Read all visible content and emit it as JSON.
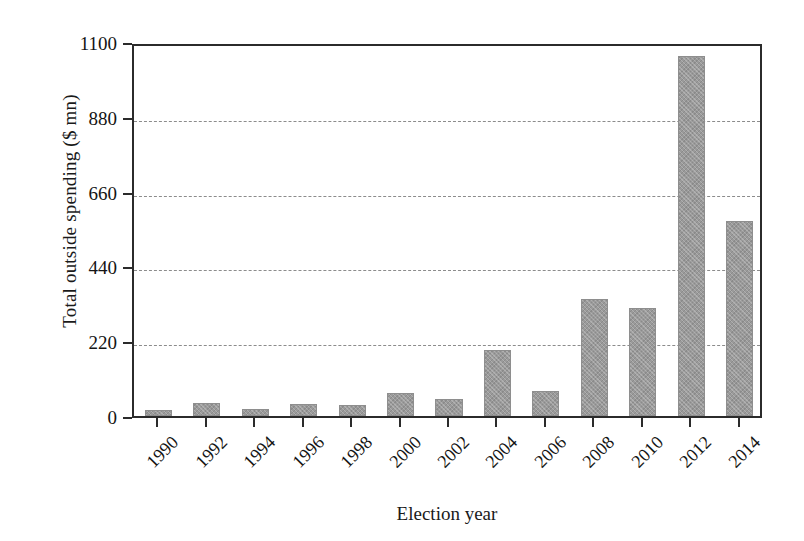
{
  "chart_data": {
    "type": "bar",
    "title": "",
    "xlabel": "Election year",
    "ylabel": "Total outside spending ($ mn)",
    "categories": [
      "1990",
      "1992",
      "1994",
      "1996",
      "1998",
      "2000",
      "2002",
      "2004",
      "2006",
      "2008",
      "2010",
      "2012",
      "2014"
    ],
    "values": [
      18,
      38,
      20,
      36,
      33,
      68,
      49,
      194,
      74,
      344,
      318,
      1059,
      573
    ],
    "ylim": [
      0,
      1100
    ],
    "yticks": [
      0,
      220,
      440,
      660,
      880,
      1100
    ],
    "ytick_labels": [
      "0",
      "220",
      "440",
      "660",
      "880",
      "1100"
    ],
    "grid": true,
    "grid_style": "dashed horizontal",
    "legend": "none",
    "bar_color": "#9a9a9a",
    "axis_color": "#2b2b2b",
    "background": "#ffffff",
    "series": [
      {
        "name": "Total outside spending",
        "values": [
          18,
          38,
          20,
          36,
          33,
          68,
          49,
          194,
          74,
          344,
          318,
          1059,
          573
        ]
      }
    ]
  }
}
